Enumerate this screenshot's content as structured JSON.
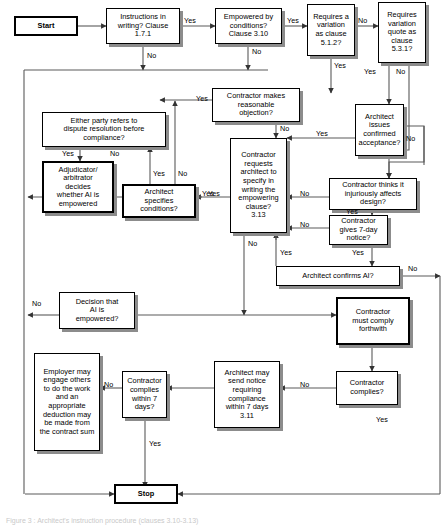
{
  "diagram": {
    "caption": "Figure 3 : Architect's instruction procedure (clauses 3.10-3.13)",
    "theme": {
      "background": "#ffffff",
      "line": "#595959",
      "border": "#000000",
      "shadow": "#8c8c8c",
      "text": "#000000"
    },
    "terminators": {
      "start": "Start",
      "stop": "Stop"
    },
    "nodes": [
      {
        "id": "start",
        "text": "Start"
      },
      {
        "id": "instructions",
        "text": "Instructions in\nwriting? Clause\n1.7.1"
      },
      {
        "id": "empowered",
        "text": "Empowered by\nconditions?\nClause 3.10"
      },
      {
        "id": "variation",
        "text": "Requires a\nvariation\nas clause\n5.1.2?"
      },
      {
        "id": "quote",
        "text": "Requires\nvariation\nquote as\nclause\n5.3.1?"
      },
      {
        "id": "objection",
        "text": "Contractor makes\nreasonable\nobjection?"
      },
      {
        "id": "confirmed",
        "text": "Architect\nissues\nconfirmed\nacceptance?"
      },
      {
        "id": "dispute",
        "text": "Either party refers to\ndispute resolution before\ncompliance?"
      },
      {
        "id": "adjudicator",
        "text": "Adjudicator/\narbitrator\ndecides\nwhether AI is\nempowered"
      },
      {
        "id": "specifies",
        "text": "Architect\nspecifies\nconditions?"
      },
      {
        "id": "requests",
        "text": "Contractor\nrequests\narchitect to\nspecify in\nwriting the\nempowering\nclause?\n3.13"
      },
      {
        "id": "injurious",
        "text": "Contractor thinks it\ninjuriously affects\ndesign?"
      },
      {
        "id": "sevenday",
        "text": "Contractor\ngives 7-day\nnotice?"
      },
      {
        "id": "confirmsai",
        "text": "Architect confirms AI?"
      },
      {
        "id": "decision",
        "text": "Decision that\nAI is\nempowered?"
      },
      {
        "id": "mustcomply",
        "text": "Contractor\nmust comply\nforthwith"
      },
      {
        "id": "employer",
        "text": "Employer may\nengage others\nto do the work\nand an\nappropriate\ndeduction may\nbe made from\nthe contract sum"
      },
      {
        "id": "complies7",
        "text": "Contractor\ncomplies\nwithin 7\ndays?"
      },
      {
        "id": "notice",
        "text": "Architect may\nsend notice\nrequiring\ncompliance\nwithin 7 days\n3.11"
      },
      {
        "id": "complies",
        "text": "Contractor\ncomplies?"
      },
      {
        "id": "stop",
        "text": "Stop"
      }
    ],
    "edge_labels": [
      {
        "id": "l-instr-yes",
        "text": "Yes"
      },
      {
        "id": "l-instr-no",
        "text": "No"
      },
      {
        "id": "l-emp-yes",
        "text": "Yes"
      },
      {
        "id": "l-emp-no",
        "text": "No"
      },
      {
        "id": "l-var-no",
        "text": "No"
      },
      {
        "id": "l-var-yes",
        "text": "Yes"
      },
      {
        "id": "l-quote-yes",
        "text": "Yes"
      },
      {
        "id": "l-quote-no",
        "text": "No"
      },
      {
        "id": "l-obj-yes",
        "text": "Yes"
      },
      {
        "id": "l-obj-no",
        "text": "No"
      },
      {
        "id": "l-conf-yes",
        "text": "Yes"
      },
      {
        "id": "l-conf-no",
        "text": "No"
      },
      {
        "id": "l-disp-yes",
        "text": "Yes"
      },
      {
        "id": "l-disp-no",
        "text": "No"
      },
      {
        "id": "l-spec-yes",
        "text": "Yes"
      },
      {
        "id": "l-spec-yes2",
        "text": "Yes"
      },
      {
        "id": "l-spec-no",
        "text": "No"
      },
      {
        "id": "l-req-yes",
        "text": "Yes"
      },
      {
        "id": "l-req-no",
        "text": "No"
      },
      {
        "id": "l-inj-no",
        "text": "No"
      },
      {
        "id": "l-inj-yes",
        "text": "Yes"
      },
      {
        "id": "l-7day-no",
        "text": "No"
      },
      {
        "id": "l-7day-yes",
        "text": "Yes"
      },
      {
        "id": "l-ai-yes",
        "text": "Yes"
      },
      {
        "id": "l-ai-no",
        "text": "No"
      },
      {
        "id": "l-dec-no",
        "text": "No"
      },
      {
        "id": "l-c7-no",
        "text": "No"
      },
      {
        "id": "l-c7-yes",
        "text": "Yes"
      },
      {
        "id": "l-comp-no",
        "text": "No"
      },
      {
        "id": "l-comp-yes",
        "text": "Yes"
      }
    ]
  }
}
